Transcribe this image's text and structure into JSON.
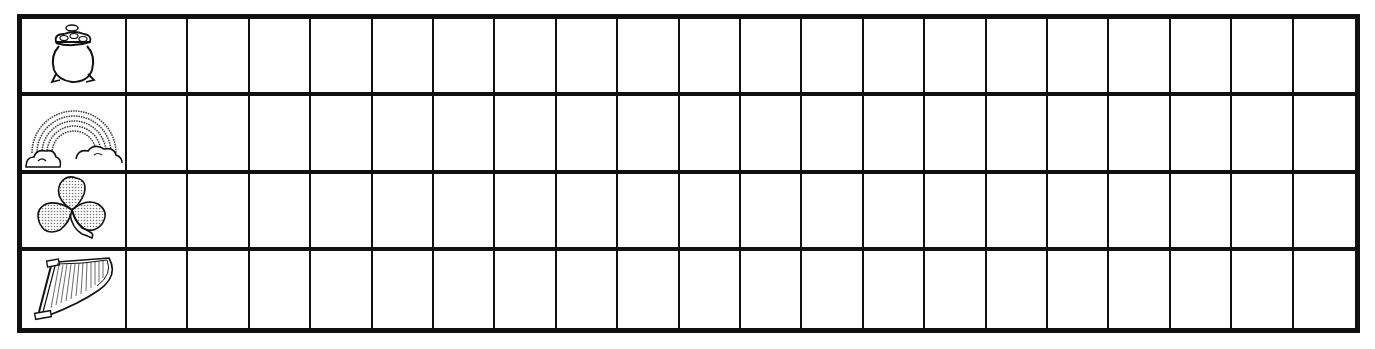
{
  "worksheet": {
    "type": "tally-grid",
    "columns_blank": 20,
    "rows": [
      {
        "icon": "pot-of-gold-icon",
        "label": "pot of gold"
      },
      {
        "icon": "rainbow-icon",
        "label": "rainbow"
      },
      {
        "icon": "shamrock-icon",
        "label": "shamrock"
      },
      {
        "icon": "harp-icon",
        "label": "harp"
      }
    ],
    "colors": {
      "line": "#111111",
      "background": "#ffffff"
    }
  }
}
